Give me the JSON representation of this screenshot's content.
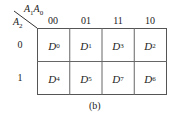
{
  "corner": {
    "col_vars": "A1A0",
    "row_var": "A2"
  },
  "col_headers": [
    "00",
    "01",
    "11",
    "10"
  ],
  "row_headers": [
    "0",
    "1"
  ],
  "cells": [
    [
      {
        "base": "D",
        "sub": "0"
      },
      {
        "base": "D",
        "sub": "1"
      },
      {
        "base": "D",
        "sub": "3"
      },
      {
        "base": "D",
        "sub": "2"
      }
    ],
    [
      {
        "base": "D",
        "sub": "4"
      },
      {
        "base": "D",
        "sub": "5"
      },
      {
        "base": "D",
        "sub": "7"
      },
      {
        "base": "D",
        "sub": "6"
      }
    ]
  ],
  "caption": "(b)"
}
